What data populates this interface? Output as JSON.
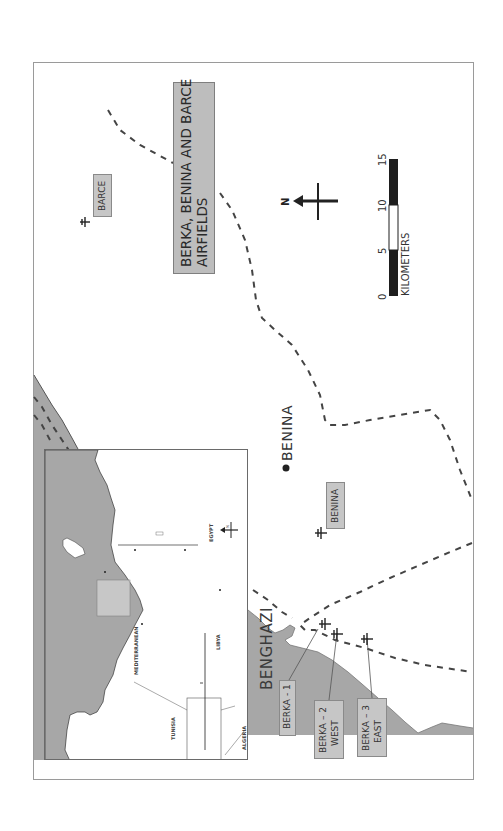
{
  "map": {
    "title": {
      "line1": "BERKA, BENINA AND BARCE",
      "line2": "AIRFIELDS"
    },
    "colors": {
      "sea": "#a7a7a7",
      "land": "#ffffff",
      "label_box": "#c6c6c6",
      "title_box": "#bdbdbd",
      "road": "#444444",
      "frame": "#9a9a9a"
    },
    "places": {
      "benina_town": "BENINA",
      "benghazi": "BENGHAZI"
    },
    "airfields": [
      {
        "id": "barce",
        "label": "BARCE"
      },
      {
        "id": "benina",
        "label": "BENINA"
      },
      {
        "id": "berka-1",
        "label": "BERKA - 1"
      },
      {
        "id": "berka-2",
        "line1": "BERKA – 2",
        "line2": "WEST"
      },
      {
        "id": "berka-3",
        "line1": "BERKA – 3",
        "line2": "EAST"
      }
    ],
    "north_arrow": {
      "label": "N"
    },
    "scale_bar": {
      "ticks": [
        "0",
        "5",
        "10",
        "15"
      ],
      "unit": "KILOMETERS"
    },
    "inset": {
      "banner": {
        "line1": "THE SAS IN THE DESERT WAR 1941-1942",
        "line2": "NORTH AFRICAN AIRFIELD & PORT TARGETS"
      },
      "regions": {
        "sea": "MEDITERRANEAN",
        "libya": "LIBYA",
        "egypt": "EGYPT",
        "tunisia": "TUNISIA",
        "algeria": "ALGERIA"
      },
      "north_label": "N"
    }
  }
}
